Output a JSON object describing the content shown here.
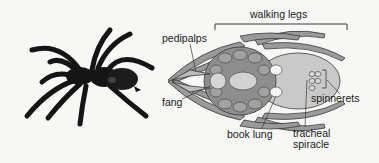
{
  "figure": {
    "photo_caption": "",
    "labels": {
      "walking_legs": "walking legs",
      "pedipalps": "pedipalps",
      "fang": "fang",
      "spinnerets": "spinnerets",
      "book_lung": "book lung",
      "tracheal_line1": "tracheal",
      "tracheal_line2": "spiracle"
    }
  },
  "colors": {
    "background": "#f7f7f5",
    "spider_photo": "#151515",
    "leg_fill": "#9a9a9a",
    "body_fill": "#c9c9c9",
    "plate_fill": "#8e8e8e",
    "outline": "#3a3a3a",
    "text": "#1a1a1a"
  }
}
